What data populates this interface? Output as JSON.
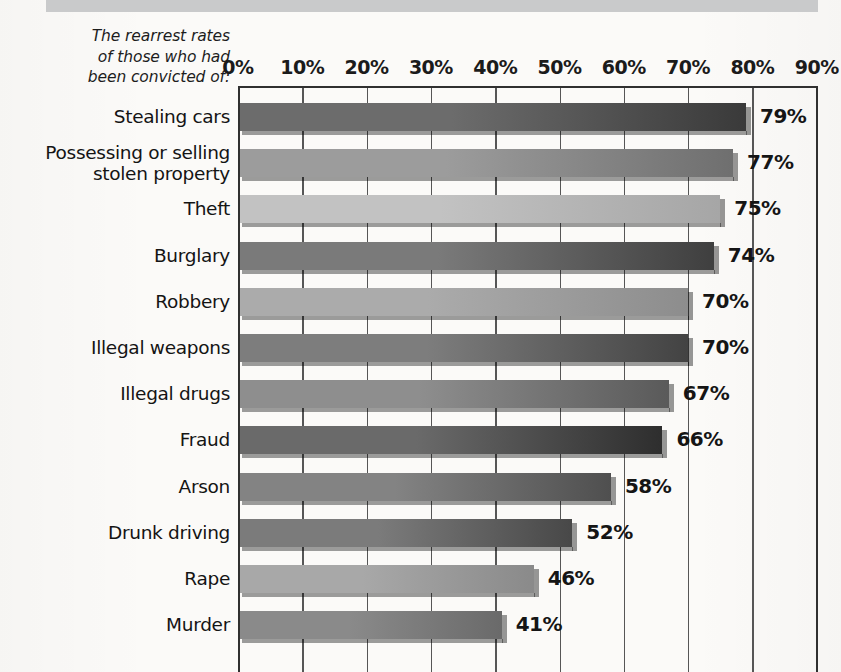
{
  "figure": {
    "caption_lines": [
      "The rearrest rates",
      "of those who had",
      "been convicted of:"
    ],
    "top_bar_color": "#c9cacb",
    "background_color": "#fbfaf8"
  },
  "chart_data": {
    "type": "bar",
    "orientation": "horizontal",
    "xlabel": "",
    "ylabel": "",
    "xlim": [
      0,
      90
    ],
    "grid": true,
    "legend": "none",
    "tick_labels": [
      "0%",
      "10%",
      "20%",
      "30%",
      "40%",
      "50%",
      "60%",
      "70%",
      "80%",
      "90%"
    ],
    "tick_values": [
      0,
      10,
      20,
      30,
      40,
      50,
      60,
      70,
      80,
      90
    ],
    "categories": [
      "Stealing cars",
      "Possessing or selling stolen property",
      "Theft",
      "Burglary",
      "Robbery",
      "Illegal weapons",
      "Illegal drugs",
      "Fraud",
      "Arson",
      "Drunk driving",
      "Rape",
      "Murder"
    ],
    "values": [
      79,
      77,
      75,
      74,
      70,
      70,
      67,
      66,
      58,
      52,
      46,
      41
    ],
    "value_labels": [
      "79%",
      "77%",
      "75%",
      "74%",
      "70%",
      "70%",
      "67%",
      "66%",
      "58%",
      "52%",
      "46%",
      "41%"
    ],
    "bars": [
      {
        "label": "Stealing cars",
        "label_lines": [
          "Stealing cars"
        ],
        "value": 79,
        "value_label": "79%",
        "color": "#6c6c6c",
        "color_end": "#3a3a3a"
      },
      {
        "label": "Possessing or selling stolen property",
        "label_lines": [
          "Possessing or selling",
          "stolen property"
        ],
        "value": 77,
        "value_label": "77%",
        "color": "#9c9c9c",
        "color_end": "#6f6f6f"
      },
      {
        "label": "Theft",
        "label_lines": [
          "Theft"
        ],
        "value": 75,
        "value_label": "75%",
        "color": "#c2c2c2",
        "color_end": "#a6a6a6"
      },
      {
        "label": "Burglary",
        "label_lines": [
          "Burglary"
        ],
        "value": 74,
        "value_label": "74%",
        "color": "#7a7a7a",
        "color_end": "#3f3f3f"
      },
      {
        "label": "Robbery",
        "label_lines": [
          "Robbery"
        ],
        "value": 70,
        "value_label": "70%",
        "color": "#ababab",
        "color_end": "#8d8d8d"
      },
      {
        "label": "Illegal weapons",
        "label_lines": [
          "Illegal weapons"
        ],
        "value": 70,
        "value_label": "70%",
        "color": "#7d7d7d",
        "color_end": "#434343"
      },
      {
        "label": "Illegal drugs",
        "label_lines": [
          "Illegal drugs"
        ],
        "value": 67,
        "value_label": "67%",
        "color": "#8e8e8e",
        "color_end": "#5a5a5a"
      },
      {
        "label": "Fraud",
        "label_lines": [
          "Fraud"
        ],
        "value": 66,
        "value_label": "66%",
        "color": "#6a6a6a",
        "color_end": "#2e2e2e"
      },
      {
        "label": "Arson",
        "label_lines": [
          "Arson"
        ],
        "value": 58,
        "value_label": "58%",
        "color": "#838383",
        "color_end": "#4f4f4f"
      },
      {
        "label": "Drunk driving",
        "label_lines": [
          "Drunk driving"
        ],
        "value": 52,
        "value_label": "52%",
        "color": "#7b7b7b",
        "color_end": "#484848"
      },
      {
        "label": "Rape",
        "label_lines": [
          "Rape"
        ],
        "value": 46,
        "value_label": "46%",
        "color": "#a8a8a8",
        "color_end": "#8a8a8a"
      },
      {
        "label": "Murder",
        "label_lines": [
          "Murder"
        ],
        "value": 41,
        "value_label": "41%",
        "color": "#8a8a8a",
        "color_end": "#6a6a6a"
      }
    ]
  }
}
